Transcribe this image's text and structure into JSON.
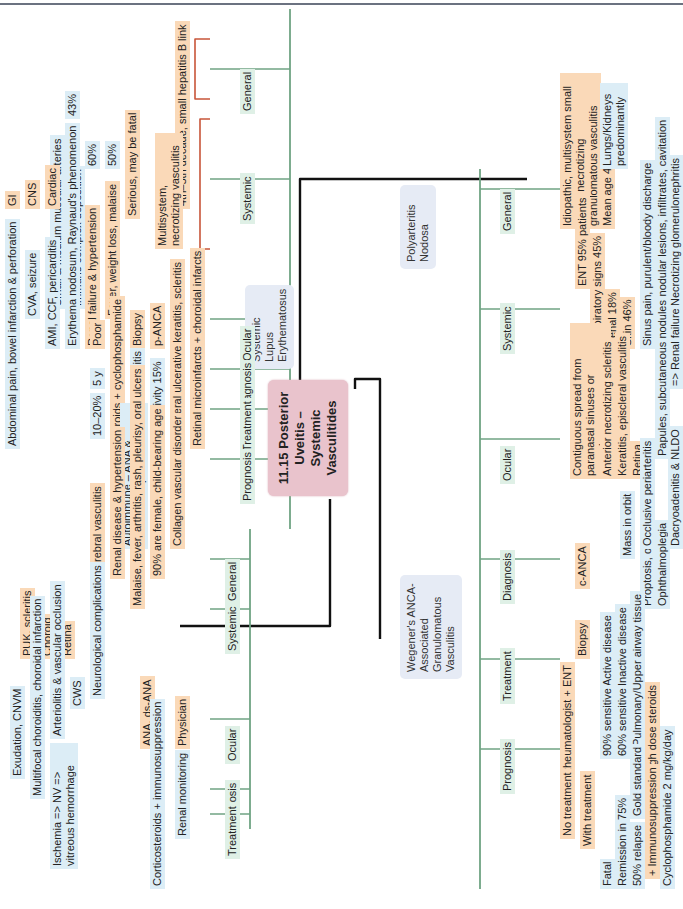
{
  "title": "11.15 Posterior Uveitis – Systemic Vasculitides",
  "colors": {
    "center": "#e9c3cc",
    "disease": "#e6ebf5",
    "category_line": "#6fa383",
    "level1_line": "#c8553a",
    "level2_line": "#4a5a9a",
    "level3_line": "#3d8fc0"
  },
  "pan": {
    "name": "Polyarteritis Nodosa",
    "general": {
      "label": "General",
      "items": [
        "4th–5th decade, small hepatitis B link",
        "Multisystem, necrotizing vasculitis",
        "Serious, may be fatal"
      ],
      "sub": [
        "Immune complex deposition",
        "Small & medium muscular arteries"
      ]
    },
    "systemic": {
      "label": "Systemic",
      "items": [
        "Fever, weight loss, malaise",
        "Renal failure & hypertension",
        "Skin",
        "Cardiac",
        "CNS",
        "GI"
      ],
      "sub": [
        "50%",
        "60%",
        "Erythema nodosum, Raynaud's phenomenon",
        "43%",
        "AMI, CCF, pericarditis",
        "CVA, seizure",
        "Abdominal pain, bowel infarction & perforation"
      ]
    },
    "ocular": {
      "label": "Ocular",
      "items": [
        "Retinal microinfarcts + choroidal infarcts",
        "Peripheral ulcerative keratitis, scleritis"
      ]
    },
    "diagnosis": {
      "label": "Diagnosis",
      "items": [
        "p-ANCA",
        "Biopsy"
      ],
      "sub": [
        "Sensitivity 15%",
        "Characteristic vasculitis"
      ]
    },
    "treatment": {
      "label": "Treatment",
      "items": [
        "Corticosteroids + cyclophosphamide"
      ]
    },
    "prognosis": {
      "label": "Prognosis",
      "items": [
        "Poor"
      ],
      "sub": [
        "5 y",
        "10–20%"
      ]
    }
  },
  "sle": {
    "name": "Systemic Lupus Erythematosus",
    "general": {
      "label": "General",
      "items": [
        "Collagen vascular disorder",
        "90% are female, child-bearing age"
      ],
      "sub": [
        "Autoimmune – ANA & immune complexes"
      ]
    },
    "systemic": {
      "label": "Systemic",
      "items": [
        "Malaise, fever, arthritis, rash, pleurisy, oral ulcers",
        "Renal disease & hypertension",
        "Cerebral vasculitis"
      ],
      "sub": [
        "Neurological complications"
      ]
    },
    "ocular": {
      "label": "Ocular",
      "items": [
        "Retina",
        "Choroid",
        "PUK, scleritis"
      ],
      "sub": [
        "CWS",
        "Arteriolitis & vascular occlusion",
        "Ischemia => NV => vitreous hemorrhage",
        "Multifocal choroiditis, choroidal infarction",
        "Exudation, CNVM"
      ]
    },
    "diagnosis": {
      "label": "Diagnosis",
      "items": [
        "ANA, ds-ANA"
      ]
    },
    "treatment": {
      "label": "Treatment",
      "items": [
        "Physician"
      ],
      "sub": [
        "Corticosteroids + immunosuppression",
        "Renal monitoring"
      ]
    }
  },
  "wegener": {
    "name": "Wegener's ANCA-Associated Granulomatous Vasculitis",
    "general": {
      "label": "General",
      "items": [
        "Idiopathic, multisystem small vessel necrotizing granulomatous vasculitis",
        "Mean age 40s"
      ],
      "sub": [
        "Lungs/Kidneys predominantly"
      ]
    },
    "systemic": {
      "label": "Systemic",
      "items": [
        "ENT 95% patients",
        "Respiratory signs 45%",
        "Renal 18%",
        "Skin 46%"
      ],
      "sub": [
        "Sinus pain, purulent/bloody discharge",
        "Multifocal nodular lesions, infiltrates, cavitation",
        "Necrotizing glomerulonephritis",
        "=> Renal failure",
        "Papules, subcutaneous nodules"
      ]
    },
    "ocular": {
      "label": "Ocular",
      "items": [
        "Contiguous spread from paranasal sinuses or nasopharynx",
        "Anterior necrotizing scleritis",
        "Keratitis, episcleral vasculitis",
        "Retina"
      ],
      "sub": [
        "Mass in orbit",
        "Proptosis, orbital congestion",
        "Ophthalmoplegia",
        "Dacryoadenitis & NLDO",
        "Occlusive periarteritis"
      ]
    },
    "diagnosis": {
      "label": "Diagnosis",
      "items": [
        "c-ANCA",
        "Biopsy"
      ],
      "sub": [
        "Active disease",
        "90% sensitive",
        "Inactive disease",
        "60% sensitive",
        "Pulmonary/Upper airway tissue",
        "Gold standard"
      ]
    },
    "treatment": {
      "label": "Treatment",
      "items": [
        "Rheumatologist + ENT",
        "High dose steroids",
        "+ Immunosuppression"
      ],
      "sub": [
        "Cyclophosphamide 2 mg/kg/day"
      ]
    },
    "prognosis": {
      "label": "Prognosis",
      "items": [
        "No treatment",
        "With treatment"
      ],
      "sub": [
        "Fatal",
        "Remission in 75%",
        "50% relapse"
      ]
    }
  }
}
